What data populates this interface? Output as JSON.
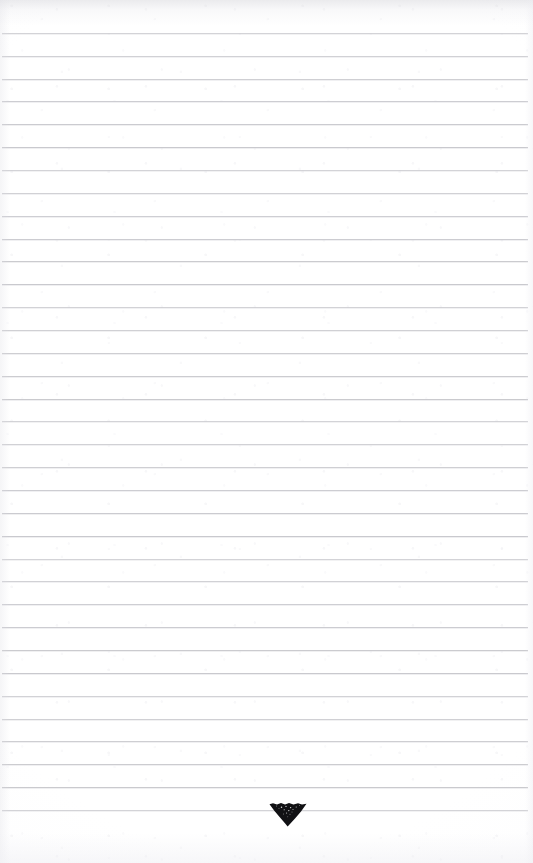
{
  "document": {
    "type": "scanned-ruled-notebook-page",
    "title": "Blank ruled notebook page",
    "page_width": 533,
    "page_height": 863,
    "background_color": "#ffffff",
    "text_content": "",
    "has_handwriting": false
  },
  "ruling": {
    "line_color": "#c9c9ce",
    "line_thickness_px": 1,
    "line_spacing_px": 22.8,
    "first_line_y": 33,
    "line_count": 35,
    "left_margin_px": 2,
    "right_margin_px": 5,
    "margin_rule": "none",
    "lines_y": [
      33,
      56,
      79,
      101,
      124,
      147,
      170,
      193,
      216,
      239,
      261,
      284,
      307,
      330,
      353,
      376,
      399,
      421,
      444,
      467,
      490,
      513,
      536,
      559,
      581,
      604,
      627,
      650,
      673,
      696,
      719,
      741,
      764,
      787,
      810
    ]
  },
  "marks": [
    {
      "name": "ink-triangle-mark",
      "shape": "filled-downward-triangle",
      "description": "Small dark hand-inked arrowhead blot sitting on the last ruled line",
      "color": "#111114",
      "center_x": 288,
      "top_y": 803,
      "tip_y": 824,
      "width_px": 36,
      "height_px": 21,
      "on_line_index": 34
    }
  ],
  "scan_artifacts": {
    "top_edge_shadow": true,
    "left_edge_shadow": true,
    "bottom_edge_fade": true,
    "paper_grain": true,
    "vignette": true
  }
}
